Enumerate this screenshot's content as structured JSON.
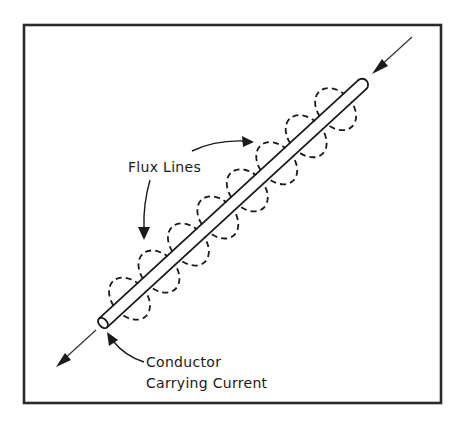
{
  "figure": {
    "labels": {
      "flux_lines": "Flux Lines",
      "conductor_line1": "Conductor",
      "conductor_line2": "Carrying Current"
    },
    "colors": {
      "ink": "#1a1a1a",
      "frame": "#2a2a2a",
      "background": "#ffffff"
    },
    "elements": {
      "conductor": "cylindrical-conductor",
      "flux_loop_count": 8,
      "current_direction": "top-right to bottom-left"
    }
  }
}
